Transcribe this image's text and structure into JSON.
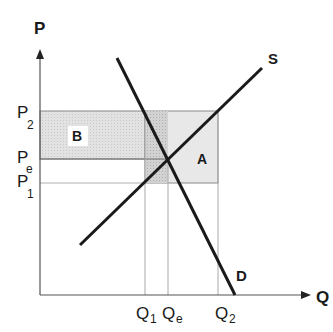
{
  "diagram": {
    "axes": {
      "y_label": "P",
      "x_label": "Q"
    },
    "price_levels": [
      {
        "base": "P",
        "sub": "2",
        "id": "P2"
      },
      {
        "base": "P",
        "sub": "e",
        "id": "Pe"
      },
      {
        "base": "P",
        "sub": "1",
        "id": "P1"
      }
    ],
    "quantity_levels": [
      {
        "base": "Q",
        "sub": "1",
        "id": "Q1"
      },
      {
        "base": "Q",
        "sub": "e",
        "id": "Qe"
      },
      {
        "base": "Q",
        "sub": "2",
        "id": "Q2"
      }
    ],
    "curves": {
      "supply": "S",
      "demand": "D"
    },
    "areas": {
      "a": "A",
      "b": "B"
    },
    "colors": {
      "line": "#1a1a1a",
      "guide": "#9a9a9a",
      "shade_light": "#e4e4e4",
      "shade_dark": "#cfcfcf"
    }
  }
}
